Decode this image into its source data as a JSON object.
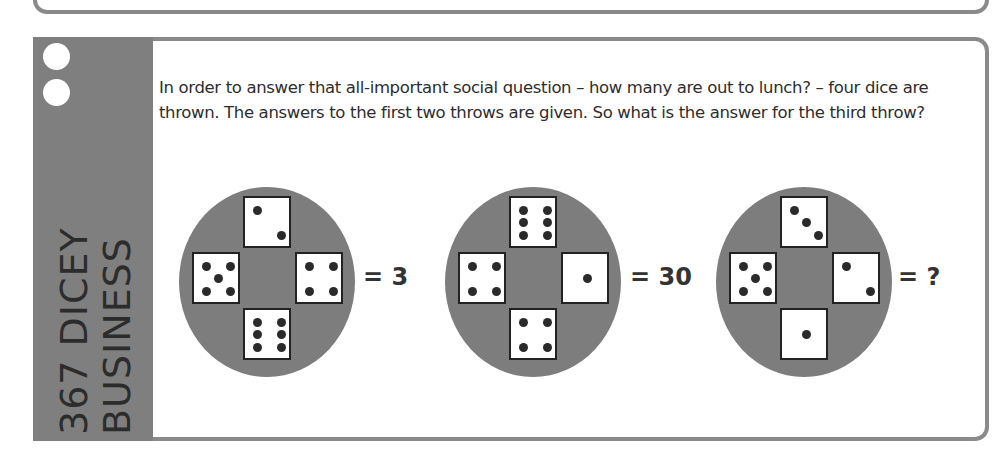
{
  "puzzle": {
    "number": "367",
    "title_line1": "367 DICEY",
    "title_line2": "BUSINESS",
    "question": "In order to answer that all-important social question – how many are out to lunch? – four dice are thrown. The answers to the first two throws are given. So what is the answer for the third throw?"
  },
  "throws": [
    {
      "top": 2,
      "left": 5,
      "right": 4,
      "bottom": 6,
      "result": "= 3"
    },
    {
      "top": 6,
      "left": 4,
      "right": 1,
      "bottom": 4,
      "result": "= 30"
    },
    {
      "top": 3,
      "left": 5,
      "right": 2,
      "bottom": 1,
      "result": "= ?"
    }
  ],
  "colors": {
    "sidebar": "#7f7f7f",
    "circle": "#7d7d7d",
    "border": "#8a8a8a",
    "text": "#2d2d2d"
  }
}
